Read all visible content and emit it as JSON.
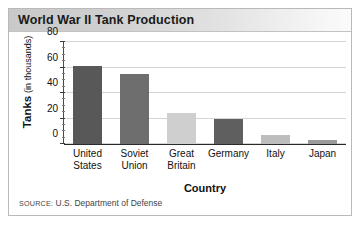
{
  "title": "World War II Tank Production",
  "source_prefix": "SOURCE:",
  "source_text": "U.S. Department of Defense",
  "axis": {
    "ylabel_strong": "Tanks",
    "ylabel_light": "(in thousands)",
    "xlabel": "Country"
  },
  "chart_data": {
    "type": "bar",
    "title": "World War II Tank Production",
    "xlabel": "Country",
    "ylabel": "Tanks (in thousands)",
    "ylim": [
      0,
      80
    ],
    "yticks": [
      0,
      20,
      40,
      60,
      80
    ],
    "ytick_labels": [
      "0",
      "20",
      "40",
      "60",
      "80"
    ],
    "minor_tick_interval": 5,
    "grid": true,
    "legend": "none",
    "categories": [
      "United States",
      "Soviet Union",
      "Great Britain",
      "Germany",
      "Italy",
      "Japan"
    ],
    "category_lines": [
      [
        "United",
        "States"
      ],
      [
        "Soviet",
        "Union"
      ],
      [
        "Great",
        "Britain"
      ],
      [
        "Germany"
      ],
      [
        "Italy"
      ],
      [
        "Japan"
      ]
    ],
    "values": [
      61,
      55,
      24,
      20,
      7,
      3
    ],
    "bar_colors": [
      "#585858",
      "#6e6e6e",
      "#cfcfcf",
      "#5f5f5f",
      "#bdbdbd",
      "#9a9a9a"
    ]
  },
  "colors": {
    "header_band_start": "#c9c9c9",
    "header_band_end": "#fbfbfb",
    "frame_border": "#b9b9b9",
    "gridline": "#d5d5d5",
    "axis": "#2a2a2a",
    "text": "#111111"
  }
}
